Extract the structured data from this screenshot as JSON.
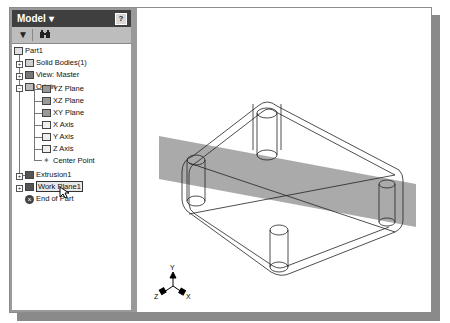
{
  "browser": {
    "title": "Model",
    "dropdown_glyph": "▾",
    "help_label": "?",
    "toolbar": [
      {
        "name": "filter",
        "glyph": "▼"
      },
      {
        "name": "find",
        "glyph": "⚲"
      }
    ],
    "tree": {
      "root": "Part1",
      "items": [
        {
          "label": "Solid Bodies(1)",
          "expander": "+",
          "icon": "solid-bodies-icon"
        },
        {
          "label": "View: Master",
          "expander": "+",
          "icon": "view-icon"
        },
        {
          "label": "Origin",
          "expander": "−",
          "icon": "folder-icon",
          "children": [
            {
              "label": "YZ Plane",
              "icon": "plane-icon"
            },
            {
              "label": "XZ Plane",
              "icon": "plane-icon"
            },
            {
              "label": "XY Plane",
              "icon": "plane-icon"
            },
            {
              "label": "X Axis",
              "icon": "axis-icon"
            },
            {
              "label": "Y Axis",
              "icon": "axis-icon"
            },
            {
              "label": "Z Axis",
              "icon": "axis-icon"
            },
            {
              "label": "Center Point",
              "icon": "point-icon"
            }
          ]
        },
        {
          "label": "Extrusion1",
          "expander": "+",
          "icon": "extrusion-icon"
        },
        {
          "label": "Work Plane1",
          "expander": "+",
          "icon": "work-plane-icon",
          "selected": true
        },
        {
          "label": "End of Part",
          "icon": "end-of-part-icon"
        }
      ]
    }
  },
  "viewport": {
    "triad": {
      "x": "X",
      "y": "Y",
      "z": "Z"
    },
    "work_plane_color": "#9b9b9b"
  }
}
